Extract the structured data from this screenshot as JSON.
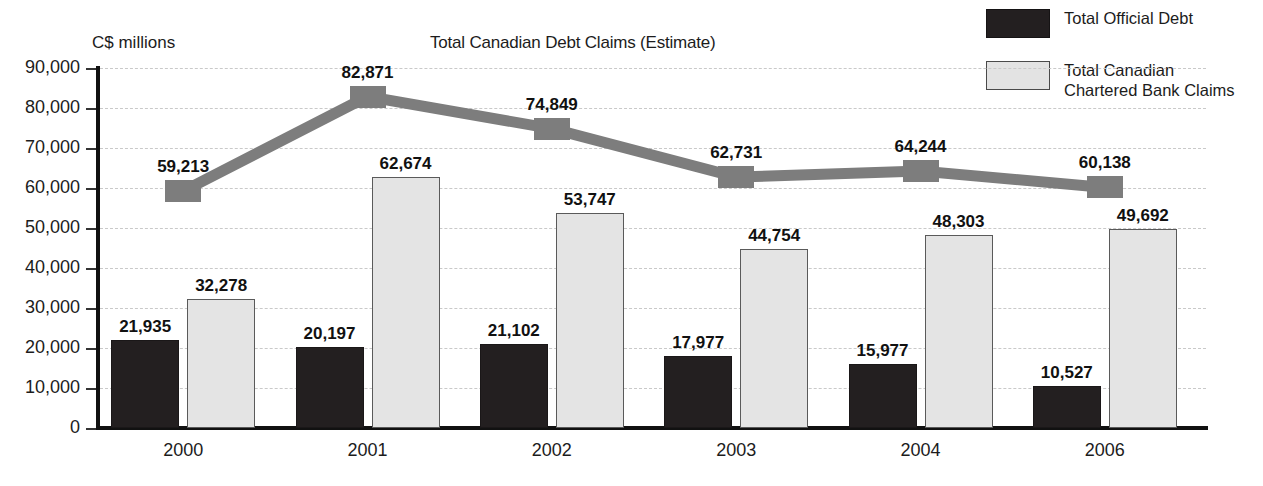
{
  "chart_data": {
    "type": "bar",
    "title": "Total Canadian Debt Claims (Estimate)",
    "ylabel": "C$ millions",
    "xlabel": "",
    "categories": [
      "2000",
      "2001",
      "2002",
      "2003",
      "2004",
      "2006"
    ],
    "ylim": [
      0,
      90000
    ],
    "ytick_labels": [
      "90,000",
      "80,000",
      "70,000",
      "60,000",
      "50,000",
      "40,000",
      "30,000",
      "20,000",
      "10,000",
      "0"
    ],
    "ytick_values": [
      90000,
      80000,
      70000,
      60000,
      50000,
      40000,
      30000,
      20000,
      10000,
      0
    ],
    "grid": true,
    "legend_position": "top-right",
    "series": [
      {
        "name": "Total Official  Debt",
        "kind": "bar",
        "color": "#231f20",
        "values": [
          21935,
          20197,
          21102,
          17977,
          15977,
          10527
        ],
        "labels": [
          "21,935",
          "20,197",
          "21,102",
          "17,977",
          "15,977",
          "10,527"
        ]
      },
      {
        "name": "Total Canadian\nChartered Bank Claims",
        "kind": "bar",
        "color": "#e4e4e4",
        "values": [
          32278,
          62674,
          53747,
          44754,
          48303,
          49692
        ],
        "labels": [
          "32,278",
          "62,674",
          "53,747",
          "44,754",
          "48,303",
          "49,692"
        ]
      },
      {
        "name": "Total Canadian Debt Claims (Estimate)",
        "kind": "line",
        "color": "#7d7d7d",
        "values": [
          59213,
          82871,
          74849,
          62731,
          64244,
          60138
        ],
        "labels": [
          "59,213",
          "82,871",
          "74,849",
          "62,731",
          "64,244",
          "60,138"
        ]
      }
    ]
  },
  "legend": {
    "items": [
      {
        "label": "Total Official  Debt",
        "swatch": "dark-square-icon"
      },
      {
        "label": "Total Canadian\nChartered Bank Claims",
        "swatch": "light-square-icon"
      }
    ]
  }
}
